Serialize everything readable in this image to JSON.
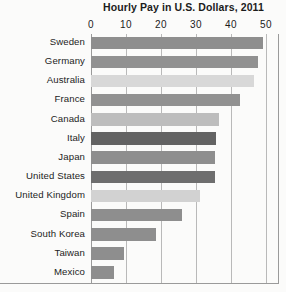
{
  "chart_data": {
    "type": "bar",
    "orientation": "horizontal",
    "title": "Hourly Pay in U.S. Dollars, 2011",
    "xlabel": "",
    "ylabel": "",
    "xlim": [
      0,
      50
    ],
    "xticks": [
      0,
      10,
      20,
      30,
      40,
      50
    ],
    "xtick_labels": [
      "0",
      "10",
      "20",
      "30",
      "40",
      "50"
    ],
    "grid": true,
    "legend": false,
    "categories": [
      "Sweden",
      "Germany",
      "Australia",
      "France",
      "Canada",
      "Italy",
      "Japan",
      "United States",
      "United Kingdom",
      "Spain",
      "South Korea",
      "Taiwan",
      "Mexico"
    ],
    "values": [
      49,
      47.7,
      46.5,
      42.5,
      36.5,
      35.8,
      35.5,
      35.5,
      31,
      26,
      18.5,
      9.5,
      6.5
    ],
    "bar_colors": [
      "#8e8e8e",
      "#919191",
      "#d8d8d8",
      "#919191",
      "#bdbdbd",
      "#636363",
      "#8e8e8e",
      "#6e6e6e",
      "#d2d2d2",
      "#8e8e8e",
      "#8e8e8e",
      "#8e8e8e",
      "#8e8e8e"
    ],
    "highlighted_category": "Italy"
  },
  "style": {
    "background": "#fbfbfa",
    "gridline_color": "#b9b9b9",
    "axis_color": "#9a9a9a",
    "text_color": "#1c1c1c"
  }
}
